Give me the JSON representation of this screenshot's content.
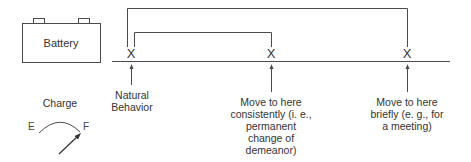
{
  "battery": {
    "label": "Battery"
  },
  "gauge": {
    "title": "Charge",
    "empty_label": "E",
    "full_label": "F"
  },
  "scale": {
    "marker_glyph": "X",
    "points": [
      {
        "id": "natural",
        "label_lines": [
          "Natural",
          "Behavior"
        ]
      },
      {
        "id": "consistent",
        "label_lines": [
          "Move to here",
          "consistently (i. e.,",
          "permanent",
          "change of",
          "demeanor)"
        ]
      },
      {
        "id": "brief",
        "label_lines": [
          "Move to here",
          "briefly (e. g., for",
          "a meeting)"
        ]
      }
    ]
  },
  "colors": {
    "line": "#4a4a4a",
    "text": "#333333",
    "background": "#ffffff"
  }
}
